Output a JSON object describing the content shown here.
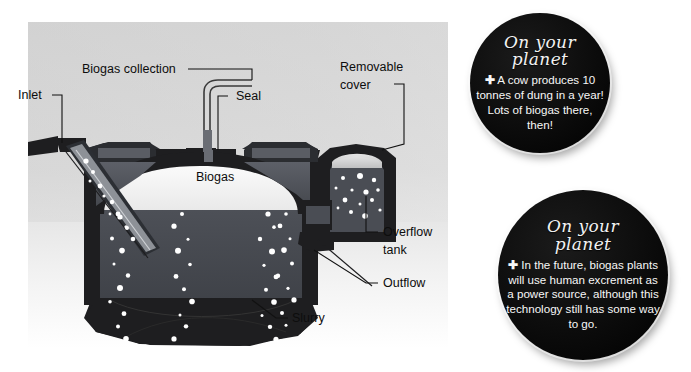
{
  "figure": {
    "kind": "cutaway-diagram"
  },
  "diagram": {
    "labels": [
      {
        "id": "inlet",
        "text": "Inlet",
        "x": 18,
        "y": 97,
        "size": 12.5
      },
      {
        "id": "biogas-collection",
        "text": "Biogas collection",
        "x": 82,
        "y": 72,
        "size": 12.5
      },
      {
        "id": "seal",
        "text": "Seal",
        "x": 236,
        "y": 99,
        "size": 12.5
      },
      {
        "id": "removable-cover-1",
        "text": "Removable",
        "x": 340,
        "y": 68,
        "size": 12.5
      },
      {
        "id": "removable-cover-2",
        "text": "cover",
        "x": 340,
        "y": 86,
        "size": 12.5
      },
      {
        "id": "overflow-tank-1",
        "text": "Overflow",
        "x": 383,
        "y": 234,
        "size": 12.5
      },
      {
        "id": "overflow-tank-2",
        "text": "tank",
        "x": 383,
        "y": 252,
        "size": 12.5
      },
      {
        "id": "outflow",
        "text": "Outflow",
        "x": 383,
        "y": 285,
        "size": 12.5
      },
      {
        "id": "slurry",
        "text": "Slurry",
        "x": 292,
        "y": 320,
        "size": 12.5
      },
      {
        "id": "biogas-chamber",
        "text": "Biogas",
        "x": 196,
        "y": 177,
        "size": 12.5
      }
    ],
    "colors": {
      "panel_top": "#d6d6d6",
      "panel_bottom": "#ffffff",
      "wall_dark": "#1e1e20",
      "wall_mid": "#53565c",
      "slurry": "#44474d",
      "gas_space": "#f2f2f2",
      "bubble": "#ffffff"
    }
  },
  "notes": [
    {
      "id": "note-cow-dung",
      "title_line1": "On your",
      "title_line2": "planet",
      "bullet": "✚",
      "body": "A cow produces 10 tonnes of dung in a year! Lots of biogas there, then!",
      "cx": 540,
      "cy": 83,
      "r": 70,
      "title_size": 17,
      "body_size": 11.6
    },
    {
      "id": "note-human-excrement",
      "title_line1": "On your",
      "title_line2": "planet",
      "bullet": "✚",
      "body": "In the future, biogas plants will use human excrement as a power source, although this technology still has some way to go.",
      "cx": 583,
      "cy": 275,
      "r": 85,
      "title_size": 17,
      "body_size": 11.6
    }
  ]
}
